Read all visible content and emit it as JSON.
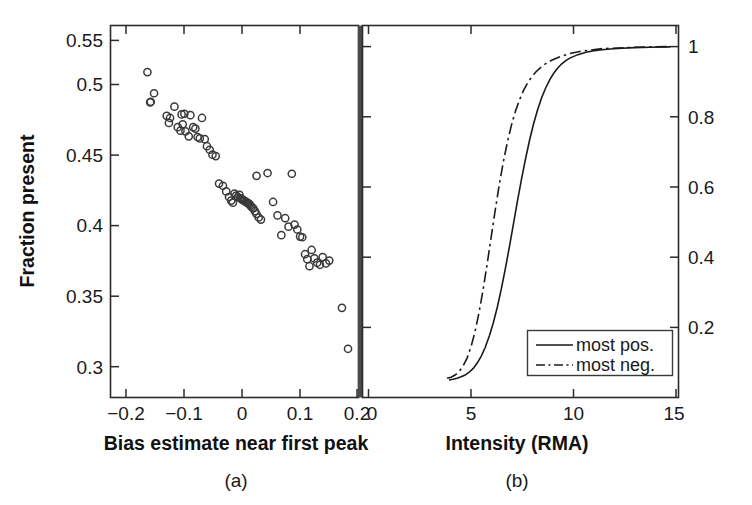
{
  "figure": {
    "background_color": "#ffffff",
    "ink_color": "#1a1a1a"
  },
  "chart_data": [
    {
      "type": "scatter",
      "panel": "a",
      "caption": "(a)",
      "title": "",
      "xlabel": "Bias estimate near first peak",
      "ylabel": "Fraction present",
      "xlim": [
        -0.235,
        0.215
      ],
      "ylim": [
        0.295,
        0.5585
      ],
      "xticks": [
        -0.2,
        -0.1,
        0,
        0.1,
        0.2
      ],
      "xticklabels": [
        "−0.2",
        "−0.1",
        "0",
        "0.1",
        "0.2"
      ],
      "yticks": [
        0.3,
        0.35,
        0.4,
        0.45,
        0.5,
        0.55
      ],
      "yticklabels": [
        "0.3",
        "0.35",
        "0.4",
        "0.45",
        "0.5",
        "0.55"
      ],
      "grid": false,
      "legend": null,
      "marker": "open-circle",
      "x": [
        -0.168,
        -0.156,
        -0.162,
        -0.163,
        -0.133,
        -0.127,
        -0.129,
        -0.119,
        -0.113,
        -0.108,
        -0.106,
        -0.104,
        -0.101,
        -0.099,
        -0.093,
        -0.09,
        -0.085,
        -0.081,
        -0.077,
        -0.073,
        -0.069,
        -0.064,
        -0.06,
        -0.055,
        -0.05,
        -0.044,
        -0.038,
        -0.031,
        -0.025,
        -0.02,
        -0.016,
        -0.013,
        -0.01,
        -0.007,
        -0.004,
        -0.001,
        0.001,
        0.003,
        0.005,
        0.007,
        0.009,
        0.011,
        0.013,
        0.015,
        0.017,
        0.019,
        0.021,
        0.024,
        0.027,
        0.03,
        0.034,
        0.038,
        0.03,
        0.05,
        0.06,
        0.068,
        0.075,
        0.082,
        0.088,
        0.094,
        0.099,
        0.104,
        0.109,
        0.113,
        0.118,
        0.122,
        0.126,
        0.13,
        0.135,
        0.14,
        0.145,
        0.15,
        0.156,
        0.162,
        0.185,
        0.196
      ],
      "y": [
        0.5255,
        0.5105,
        0.5045,
        0.504,
        0.4945,
        0.493,
        0.4895,
        0.501,
        0.4865,
        0.484,
        0.4955,
        0.4885,
        0.496,
        0.4835,
        0.48,
        0.495,
        0.4865,
        0.4855,
        0.4795,
        0.4785,
        0.493,
        0.478,
        0.473,
        0.4705,
        0.467,
        0.466,
        0.4465,
        0.445,
        0.441,
        0.437,
        0.4345,
        0.433,
        0.4395,
        0.438,
        0.437,
        0.4385,
        0.436,
        0.4355,
        0.435,
        0.4345,
        0.434,
        0.4335,
        0.433,
        0.4325,
        0.432,
        0.431,
        0.43,
        0.429,
        0.427,
        0.425,
        0.4225,
        0.421,
        0.452,
        0.454,
        0.4335,
        0.424,
        0.41,
        0.422,
        0.416,
        0.4535,
        0.4175,
        0.414,
        0.409,
        0.4085,
        0.3965,
        0.393,
        0.388,
        0.3995,
        0.3935,
        0.3905,
        0.389,
        0.3945,
        0.39,
        0.392,
        0.3585,
        0.3295
      ]
    },
    {
      "type": "line",
      "panel": "b",
      "caption": "(b)",
      "title": "",
      "xlabel": "Intensity (RMA)",
      "ylabel": "",
      "xlim": [
        -0.3,
        15.4
      ],
      "ylim": [
        0.0,
        1.06
      ],
      "xticks": [
        0,
        5,
        10,
        15
      ],
      "xticklabels": [
        "0",
        "5",
        "10",
        "15"
      ],
      "yticks": [
        0.2,
        0.4,
        0.6,
        0.8,
        1
      ],
      "yticklabels": [
        "0.2",
        "0.4",
        "0.6",
        "0.8",
        "1"
      ],
      "yaxis_position": "right",
      "grid": false,
      "legend_position": "lower right",
      "series": [
        {
          "name": "most pos.",
          "style": "solid",
          "x": [
            4.0,
            4.2,
            4.4,
            4.6,
            4.8,
            5.0,
            5.2,
            5.4,
            5.6,
            5.8,
            6.0,
            6.2,
            6.4,
            6.6,
            6.8,
            7.0,
            7.2,
            7.4,
            7.6,
            7.8,
            8.0,
            8.2,
            8.4,
            8.6,
            8.8,
            9.0,
            9.2,
            9.4,
            9.6,
            9.8,
            10.0,
            10.4,
            10.8,
            11.2,
            11.6,
            12.0,
            12.6,
            13.2,
            14.0,
            15.0
          ],
          "y": [
            0.05,
            0.052,
            0.055,
            0.059,
            0.064,
            0.072,
            0.083,
            0.098,
            0.118,
            0.143,
            0.175,
            0.213,
            0.258,
            0.31,
            0.368,
            0.43,
            0.495,
            0.56,
            0.622,
            0.68,
            0.733,
            0.78,
            0.82,
            0.854,
            0.882,
            0.905,
            0.924,
            0.939,
            0.951,
            0.96,
            0.967,
            0.977,
            0.984,
            0.988,
            0.991,
            0.993,
            0.995,
            0.997,
            0.998,
            0.999
          ]
        },
        {
          "name": "most neg.",
          "style": "dashdot",
          "x": [
            3.9,
            4.1,
            4.3,
            4.5,
            4.7,
            4.9,
            5.1,
            5.3,
            5.5,
            5.7,
            5.9,
            6.1,
            6.3,
            6.5,
            6.7,
            6.9,
            7.1,
            7.3,
            7.5,
            7.7,
            7.9,
            8.1,
            8.3,
            8.5,
            8.7,
            8.9,
            9.1,
            9.3,
            9.6,
            10.0,
            10.5,
            11.0,
            11.6,
            12.4,
            13.2,
            14.0,
            15.0
          ],
          "y": [
            0.055,
            0.058,
            0.064,
            0.074,
            0.09,
            0.113,
            0.146,
            0.19,
            0.245,
            0.31,
            0.383,
            0.46,
            0.536,
            0.608,
            0.672,
            0.728,
            0.776,
            0.816,
            0.848,
            0.875,
            0.896,
            0.913,
            0.927,
            0.938,
            0.947,
            0.955,
            0.961,
            0.966,
            0.973,
            0.98,
            0.986,
            0.99,
            0.994,
            0.996,
            0.998,
            0.999,
            1.0
          ]
        }
      ]
    }
  ]
}
